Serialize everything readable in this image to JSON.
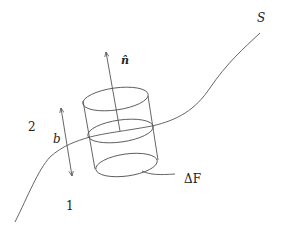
{
  "diagram": {
    "labels": {
      "surface": "S",
      "normal": "n̂",
      "height": "b",
      "region_upper": "2",
      "region_lower": "1",
      "area": "ΔF"
    },
    "colors": {
      "stroke": "#555555",
      "text": "#222222",
      "background": "#ffffff"
    },
    "elements": [
      "surface-curve-S",
      "normal-vector-arrow",
      "cylinder-top-ellipse",
      "cylinder-middle-ellipse",
      "cylinder-bottom-ellipse",
      "cylinder-side-lines",
      "height-double-arrow-b",
      "area-leader-line"
    ]
  }
}
